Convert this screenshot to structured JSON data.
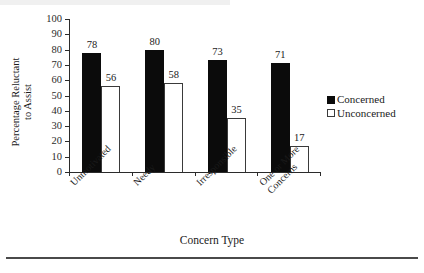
{
  "chart_data": {
    "type": "bar",
    "title": "",
    "xlabel": "Concern Type",
    "ylabel_lines": [
      "Percentage Reluctant",
      "to Assist"
    ],
    "ylabel": "Percentage Reluctant to Assist",
    "categories": [
      "Unmotivated",
      "Needy",
      "Irresponsible",
      "One or More Concerns"
    ],
    "category_lines": [
      [
        "Unmotivated"
      ],
      [
        "Needy"
      ],
      [
        "Irresponsible"
      ],
      [
        "One or More",
        "Concerns"
      ]
    ],
    "series": [
      {
        "name": "Concerned",
        "fill": "#0b0b0b",
        "values": [
          78,
          80,
          73,
          71
        ]
      },
      {
        "name": "Unconcerned",
        "fill": "#ffffff",
        "values": [
          56,
          58,
          35,
          17
        ]
      }
    ],
    "ylim": [
      0,
      100
    ],
    "yticks": [
      0,
      10,
      20,
      30,
      40,
      50,
      60,
      70,
      80,
      90,
      100
    ],
    "ytick_labels": [
      "0",
      "10",
      "20",
      "30",
      "40",
      "50",
      "60",
      "70",
      "80",
      "90",
      "100"
    ],
    "grid": false,
    "legend_position": "right",
    "legend": [
      "Concerned",
      "Unconcerned"
    ],
    "data_labels": true
  },
  "legend": {
    "concerned_label": "Concerned",
    "unconcerned_label": "Unconcerned"
  },
  "axes": {
    "x_title": "Concern Type",
    "y_title_line1": "Percentage Reluctant",
    "y_title_line2": "to Assist"
  }
}
